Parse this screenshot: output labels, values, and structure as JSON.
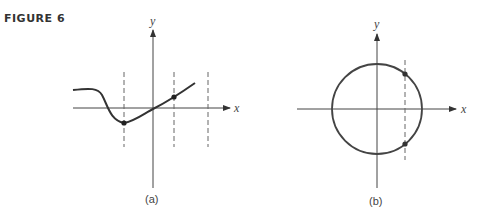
{
  "figure": {
    "label": "FIGURE 6",
    "panels": [
      {
        "id": "a",
        "caption": "(a)",
        "x_axis_label": "x",
        "y_axis_label": "y",
        "description": "Graph of a curve with three vertical dashed lines; curve crosses each dashed line at most once",
        "dashed_lines": 3,
        "marked_points": 2
      },
      {
        "id": "b",
        "caption": "(b)",
        "x_axis_label": "x",
        "y_axis_label": "y",
        "description": "Circle centered at origin; vertical dashed line intersects circle at two points",
        "dashed_lines": 1,
        "marked_points": 2
      }
    ]
  }
}
